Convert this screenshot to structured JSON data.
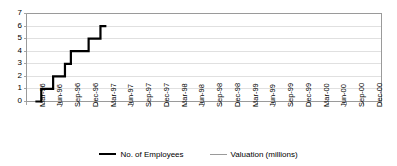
{
  "chart_data": {
    "type": "line",
    "title": "",
    "subtitle": "",
    "xlabel": "",
    "ylabel": "",
    "ylim": [
      0,
      7
    ],
    "yticks": [
      0,
      1,
      2,
      3,
      4,
      5,
      6,
      7
    ],
    "grid": true,
    "grid_axis": "y",
    "legend_position": "bottom",
    "categories": [
      "Mar-96",
      "Jun-96",
      "Sep-96",
      "Dec-96",
      "Mar-97",
      "Jun-97",
      "Sep-97",
      "Dec-97",
      "Mar-98",
      "Jun-98",
      "Sep-98",
      "Dec-98",
      "Mar-99",
      "Jun-99",
      "Sep-99",
      "Dec-99",
      "Mar-00",
      "Jun-00",
      "Sep-00",
      "Dec-00"
    ],
    "x_tick_labels": [
      "Mar-96",
      "Jun-96",
      "Sep-96",
      "Dec-96",
      "Mar-97",
      "Jun-97",
      "Sep-97",
      "Dec-97",
      "Mar-98",
      "Jun-98",
      "Sep-98",
      "Dec-98",
      "Mar-99",
      "Jun-99",
      "Sep-99",
      "Dec-99",
      "Mar-00",
      "Jun-00",
      "Sep-00",
      "Dec-00"
    ],
    "series": [
      {
        "name": "No. of Employees",
        "color": "#000000",
        "line_width": 2.2,
        "style": "step",
        "x": [
          "Mar-96",
          "Apr-96",
          "May-96",
          "Jun-96",
          "Jul-96",
          "Aug-96",
          "Sep-96",
          "Oct-96",
          "Nov-96",
          "Dec-96",
          "Jan-97",
          "Feb-97",
          "Mar-97"
        ],
        "values": [
          0,
          1,
          1,
          2,
          2,
          3,
          4,
          4,
          4,
          5,
          5,
          6,
          6
        ]
      },
      {
        "name": "Valuation (millions)",
        "color": "#9a9a9a",
        "line_width": 1.1,
        "style": "line",
        "x": [],
        "values": []
      }
    ]
  },
  "legend": {
    "items": [
      {
        "label": "No. of  Employees",
        "color": "#000000"
      },
      {
        "label": "Valuation (millions)",
        "color": "#9a9a9a"
      }
    ]
  },
  "axes": {
    "y_tick_labels": [
      "7",
      "6",
      "5",
      "4",
      "3",
      "2",
      "1",
      "0"
    ]
  },
  "colors": {
    "series_employees": "#000000",
    "series_valuation": "#9a9a9a",
    "gridline": "#d8d8d8",
    "axis": "#9a9a9a",
    "background": "#ffffff"
  }
}
